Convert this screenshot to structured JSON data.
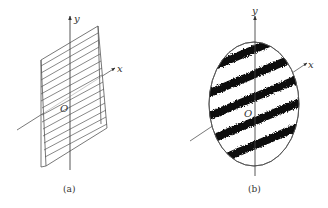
{
  "figure": {
    "panels": [
      {
        "id": "a",
        "caption": "(a)",
        "axis_labels": {
          "x": "x",
          "y": "y",
          "origin": "O"
        },
        "description": "Inclined plane with parallel straight-line stripes"
      },
      {
        "id": "b",
        "caption": "(b)",
        "axis_labels": {
          "x": "x",
          "y": "y",
          "origin": "O"
        },
        "description": "Elliptical region with dark noisy diagonal fringes"
      }
    ],
    "colors": {
      "line": "#555555",
      "ink": "#111111",
      "background": "#ffffff"
    }
  }
}
